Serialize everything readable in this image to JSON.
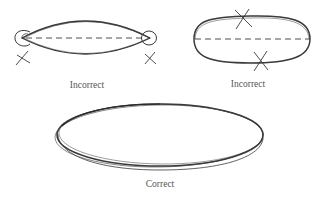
{
  "diagram": {
    "figures": [
      {
        "id": "pointed-ellipse",
        "label": "Incorrect",
        "issue": "pointed ends"
      },
      {
        "id": "flat-ellipse",
        "label": "Incorrect",
        "issue": "flattened sides"
      },
      {
        "id": "correct-ellipse",
        "label": "Correct",
        "issue": "none"
      }
    ],
    "colors": {
      "stroke": "#3a3a3a",
      "label": "#555555",
      "background": "#ffffff"
    }
  }
}
